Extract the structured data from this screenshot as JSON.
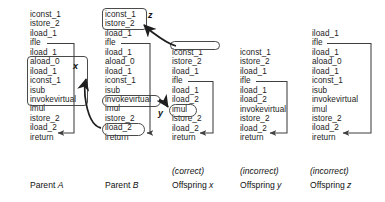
{
  "figure": {
    "columns": [
      {
        "id": "parent-a",
        "caption": "Parent A",
        "caption_italic_suffix": "A",
        "caption_prefix": "Parent",
        "sub_caption": "",
        "instructions": [
          "iconst_1",
          "istore_2",
          "iload_1",
          "ifle",
          "iload_1",
          "aload_0",
          "iload_1",
          "iconst_1",
          "isub",
          "invokevirtual",
          "imul",
          "istore_2",
          "iload_2",
          "ireturn"
        ]
      },
      {
        "id": "parent-b",
        "caption": "Parent B",
        "caption_prefix": "Parent",
        "caption_italic_suffix": "B",
        "sub_caption": "",
        "instructions": [
          "iconst_1",
          "istore_2",
          "iload_1",
          "ifle",
          "iload_1",
          "aload_0",
          "iload_1",
          "iconst_1",
          "isub",
          "invokevirtual",
          "imul",
          "istore_2",
          "iload_2",
          "ireturn"
        ]
      },
      {
        "id": "offspring-x",
        "caption": "Offspring x",
        "caption_prefix": "Offspring",
        "caption_italic_suffix": "x",
        "sub_caption": "(correct)",
        "instructions": [
          "iconst_1",
          "istore_2",
          "iload_1",
          "ifle",
          "iload_1",
          "iload_2",
          "imul",
          "istore_2",
          "iload_2",
          "ireturn"
        ]
      },
      {
        "id": "offspring-y",
        "caption": "Offspring y",
        "caption_prefix": "Offspring",
        "caption_italic_suffix": "y",
        "sub_caption": "(incorrect)",
        "instructions": [
          "iconst_1",
          "istore_2",
          "iload_1",
          "ifle",
          "iload_1",
          "iload_2",
          "invokevirtual",
          "istore_2",
          "iload_2",
          "ireturn"
        ]
      },
      {
        "id": "offspring-z",
        "caption": "Offspring z",
        "caption_prefix": "Offspring",
        "caption_italic_suffix": "z",
        "sub_caption": "(incorrect)",
        "instructions": [
          "iload_1",
          "ifle",
          "iload_1",
          "aload_0",
          "iload_1",
          "iconst_1",
          "isub",
          "invokevirtual",
          "imul",
          "istore_2",
          "iload_2",
          "ireturn"
        ]
      }
    ],
    "arrow_labels": {
      "x": "x",
      "y": "y",
      "z": "z"
    },
    "colors": {
      "ink": "#1c1c1c",
      "stroke": "#4a4a4a",
      "background": "#ffffff"
    }
  }
}
